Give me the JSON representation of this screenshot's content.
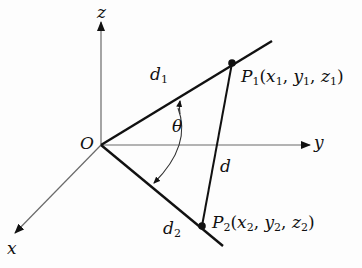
{
  "diagram": {
    "axes": {
      "x_label": "x",
      "y_label": "y",
      "z_label": "z",
      "origin_label": "O"
    },
    "lines": {
      "d1_main": "d",
      "d1_sub": "1",
      "d2_main": "d",
      "d2_sub": "2",
      "d_label": "d"
    },
    "angle_label": "θ",
    "points": {
      "p1": {
        "P": "P",
        "sub": "1",
        "open": "(",
        "x": "x",
        "xs": "1",
        "c1": ", ",
        "y": "y",
        "ys": "1",
        "c2": ", ",
        "z": "z",
        "zs": "1",
        "close": ")"
      },
      "p2": {
        "P": "P",
        "sub": "2",
        "open": "(",
        "x": "x",
        "xs": "2",
        "c1": ", ",
        "y": "y",
        "ys": "2",
        "c2": ", ",
        "z": "z",
        "zs": "2",
        "close": ")"
      }
    },
    "colors": {
      "axis": "#6a6a6a",
      "line": "#111111",
      "background": "#fdfdfd"
    }
  }
}
